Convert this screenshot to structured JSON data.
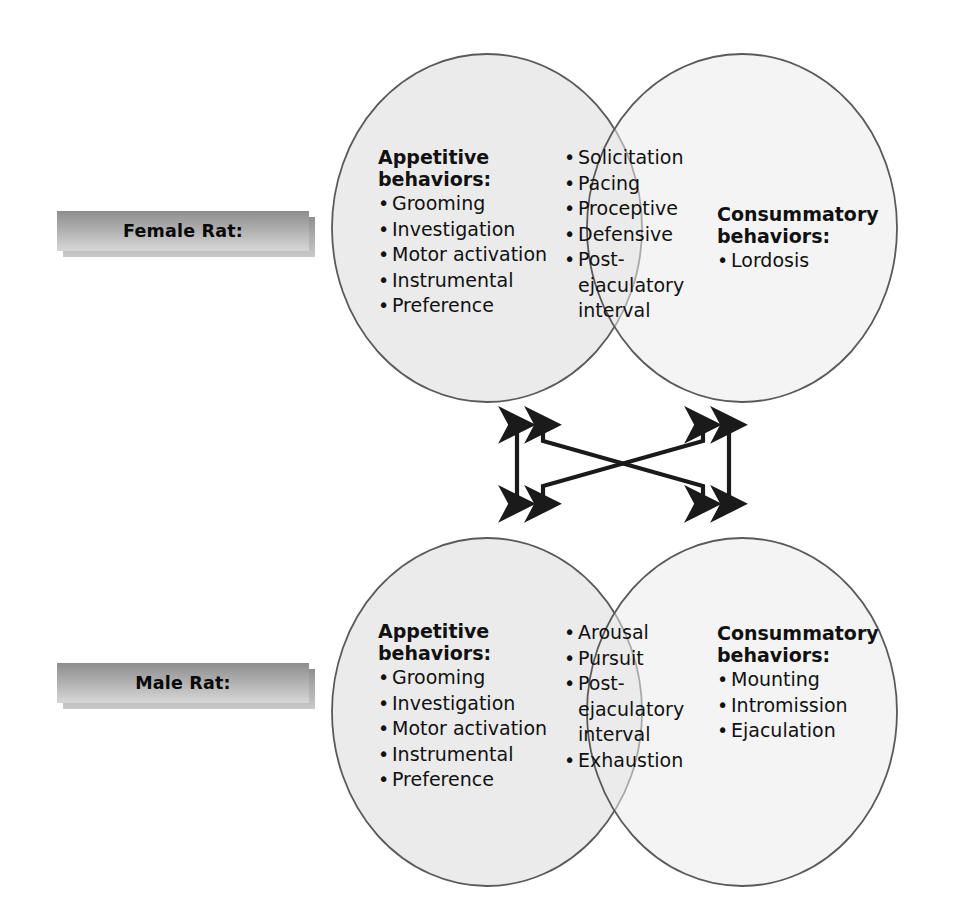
{
  "figure": {
    "type": "venn-diagram-pair",
    "colors": {
      "circle_fill": "#ebebeb",
      "circle_stroke": "#5a5a5a",
      "arrow": "#1a1a1a",
      "plaque_top": "#8d8d8d",
      "plaque_bottom": "#d6d6d6",
      "text": "#111111",
      "background": "#ffffff"
    }
  },
  "labels": [
    {
      "id": "female-rat-label",
      "text": "Female Rat:"
    },
    {
      "id": "male-rat-label",
      "text": "Male Rat:"
    }
  ],
  "bullet": "•",
  "panels": [
    {
      "id": "female",
      "label": "Female Rat:",
      "left": {
        "header": "Appetitive\nbehaviors:",
        "items": [
          "Grooming",
          "Investigation",
          "Motor activation",
          "Instrumental",
          "Preference"
        ]
      },
      "overlap": {
        "header": "",
        "items": [
          "Solicitation",
          "Pacing",
          "Proceptive",
          "Defensive",
          "Post-\nejaculatory\ninterval"
        ]
      },
      "right": {
        "header": "Consummatory\nbehaviors:",
        "items": [
          "Lordosis"
        ]
      }
    },
    {
      "id": "male",
      "label": "Male Rat:",
      "left": {
        "header": "Appetitive\nbehaviors:",
        "items": [
          "Grooming",
          "Investigation",
          "Motor activation",
          "Instrumental",
          "Preference"
        ]
      },
      "overlap": {
        "header": "",
        "items": [
          "Arousal",
          "Pursuit",
          "Post-\nejaculatory\ninterval",
          "Exhaustion"
        ]
      },
      "right": {
        "header": "Consummatory\nbehaviors:",
        "items": [
          "Mounting",
          "Intromission",
          "Ejaculation"
        ]
      }
    }
  ],
  "connectors": {
    "description": "Four double-headed arrows linking the female and male Venn diagrams",
    "arrows": [
      {
        "id": "appetitive-vertical",
        "kind": "double-headed-vertical"
      },
      {
        "id": "appetitive-to-consummatory",
        "kind": "double-headed-diagonal"
      },
      {
        "id": "consummatory-to-appetitive",
        "kind": "double-headed-diagonal"
      },
      {
        "id": "consummatory-vertical",
        "kind": "double-headed-vertical"
      }
    ]
  }
}
